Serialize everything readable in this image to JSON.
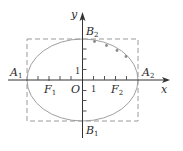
{
  "diagram": {
    "type": "ellipse-with-bounding-rectangle",
    "axes": {
      "x_label": "x",
      "y_label": "y",
      "origin_label": "O",
      "unit_label_x": "1",
      "unit_label_y": "1"
    },
    "points": {
      "A1": {
        "name": "A",
        "sub": "1"
      },
      "A2": {
        "name": "A",
        "sub": "2"
      },
      "B1": {
        "name": "B",
        "sub": "1"
      },
      "B2": {
        "name": "B",
        "sub": "2"
      },
      "F1": {
        "name": "F",
        "sub": "1"
      },
      "F2": {
        "name": "F",
        "sub": "2"
      }
    },
    "ellipse": {
      "a": 5,
      "b": 4,
      "c": 3
    },
    "rectangle": {
      "style": "dashed",
      "x_range": [
        -5,
        5
      ],
      "y_range": [
        -4,
        4
      ]
    },
    "colors": {
      "axis": "#333333",
      "ellipse": "#9a9a9a",
      "rectangle": "#9a9a9a",
      "dots": "#8a8a8a",
      "text": "#2a2a2a"
    }
  }
}
